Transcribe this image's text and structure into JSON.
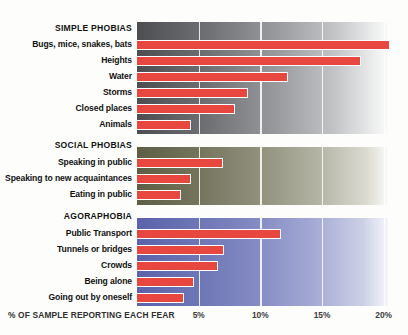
{
  "chart_data": {
    "type": "bar",
    "title": "",
    "subtitle": "",
    "orientation": "horizontal",
    "xlabel": "% OF SAMPLE REPORTING EACH FEAR",
    "ylabel": "",
    "xlim": [
      0,
      20.8
    ],
    "xticks": [
      5,
      10,
      15,
      20
    ],
    "xticklabels": [
      "5%",
      "10%",
      "15%",
      "20%"
    ],
    "grid": true,
    "gridlines_at": [
      5,
      10,
      15,
      20
    ],
    "legend": "none",
    "bar_color": "#e8473f",
    "bar_outline_color": "#ffffff",
    "groups": [
      {
        "name": "SIMPLE PHOBIAS",
        "panel_gradient_start": "#4c4e52",
        "panel_gradient_end": "#fbfbfa",
        "categories": [
          "Bugs, mice, snakes, bats",
          "Heights",
          "Water",
          "Storms",
          "Closed places",
          "Animals"
        ],
        "values": [
          20.4,
          18.1,
          12.2,
          8.9,
          7.9,
          4.3
        ]
      },
      {
        "name": "SOCIAL PHOBIAS",
        "panel_gradient_start": "#5e5e46",
        "panel_gradient_end": "#fbfbf8",
        "categories": [
          "Speaking in public",
          "Speaking to new acquaintances",
          "Eating in public"
        ],
        "values": [
          6.9,
          4.3,
          3.5
        ]
      },
      {
        "name": "AGORAPHOBIA",
        "panel_gradient_start": "#5a63ab",
        "panel_gradient_end": "#f5f6fb",
        "categories": [
          "Public Transport",
          "Tunnels or bridges",
          "Crowds",
          "Being alone",
          "Going out by oneself"
        ],
        "values": [
          11.6,
          7.0,
          6.5,
          4.5,
          3.7
        ]
      }
    ]
  },
  "axis": {
    "caption": "% OF SAMPLE REPORTING EACH FEAR",
    "ticks": [
      {
        "label": "5%",
        "value": 5
      },
      {
        "label": "10%",
        "value": 10
      },
      {
        "label": "15%",
        "value": 15
      },
      {
        "label": "20%",
        "value": 20
      }
    ]
  },
  "sections": [
    {
      "title": "SIMPLE PHOBIAS",
      "rows": [
        {
          "label": "Bugs, mice, snakes, bats",
          "value": 20.4
        },
        {
          "label": "Heights",
          "value": 18.1
        },
        {
          "label": "Water",
          "value": 12.2
        },
        {
          "label": "Storms",
          "value": 8.9
        },
        {
          "label": "Closed places",
          "value": 7.9
        },
        {
          "label": "Animals",
          "value": 4.3
        }
      ]
    },
    {
      "title": "SOCIAL PHOBIAS",
      "rows": [
        {
          "label": "Speaking in public",
          "value": 6.9
        },
        {
          "label": "Speaking to new acquaintances",
          "value": 4.3
        },
        {
          "label": "Eating in public",
          "value": 3.5
        }
      ]
    },
    {
      "title": "AGORAPHOBIA",
      "rows": [
        {
          "label": "Public Transport",
          "value": 11.6
        },
        {
          "label": "Tunnels or bridges",
          "value": 7.0
        },
        {
          "label": "Crowds",
          "value": 6.5
        },
        {
          "label": "Being alone",
          "value": 4.5
        },
        {
          "label": "Going out by oneself",
          "value": 3.7
        }
      ]
    }
  ]
}
